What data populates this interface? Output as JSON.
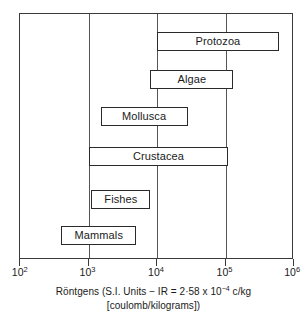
{
  "chart_data": {
    "type": "bar",
    "orientation": "horizontal",
    "title": "",
    "subtitle": "",
    "xlabel": "Röntgens (S.I. Units  −  IR  =  2·58 x 10⁻⁴ c/kg [coulomb/kilograms])",
    "ylabel": "",
    "xscale": "log",
    "xlim": [
      100,
      1000000
    ],
    "grid": true,
    "legend": null,
    "xtick_labels": [
      "10²",
      "10³",
      "10⁴",
      "10⁵",
      "10⁶"
    ],
    "xtick_values": [
      100,
      1000,
      10000,
      100000,
      1000000
    ],
    "categories": [
      "Protozoa",
      "Algae",
      "Mollusca",
      "Crustacea",
      "Fishes",
      "Mammals"
    ],
    "bars": [
      {
        "label": "Protozoa",
        "start": 10000,
        "end": 600000
      },
      {
        "label": "Algae",
        "start": 8000,
        "end": 130000
      },
      {
        "label": "Mollusca",
        "start": 1500,
        "end": 28000
      },
      {
        "label": "Crustacea",
        "start": 1000,
        "end": 110000
      },
      {
        "label": "Fishes",
        "start": 1100,
        "end": 8000
      },
      {
        "label": "Mammals",
        "start": 400,
        "end": 5000
      }
    ]
  },
  "axis": {
    "ticks": [
      {
        "label_base": "10",
        "label_exp": "2"
      },
      {
        "label_base": "10",
        "label_exp": "3"
      },
      {
        "label_base": "10",
        "label_exp": "4"
      },
      {
        "label_base": "10",
        "label_exp": "5"
      },
      {
        "label_base": "10",
        "label_exp": "6"
      }
    ]
  },
  "caption": {
    "line1_a": "Röntgens (S.I. Units  −  IR  =  2·58 x 10",
    "line1_exp": "−4",
    "line1_b": " c/kg",
    "line2": "[coulomb/kilograms])"
  },
  "bar_labels": {
    "protozoa": "Protozoa",
    "algae": "Algae",
    "mollusca": "Mollusca",
    "crustacea": "Crustacea",
    "fishes": "Fishes",
    "mammals": "Mammals"
  },
  "colors": {
    "frame": "#3a3a3a",
    "gridline": "#555555",
    "bar_border": "#2a2a2a",
    "bar_fill": "#ffffff",
    "text": "#1a1a1a",
    "background": "#ffffff"
  }
}
